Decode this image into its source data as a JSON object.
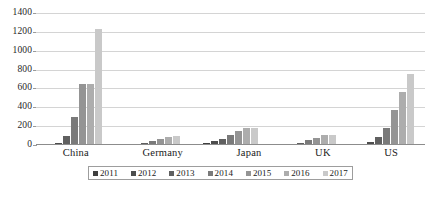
{
  "chart_data": {
    "type": "bar",
    "title": "",
    "subtitle": "",
    "xlabel": "",
    "ylabel": "",
    "categories": [
      "China",
      "Germany",
      "Japan",
      "UK",
      "US"
    ],
    "ylim": [
      0,
      1400
    ],
    "yticks": [
      1400,
      1200,
      1000,
      800,
      600,
      400,
      200,
      0
    ],
    "grid": true,
    "legend_position": "bottom",
    "series": [
      {
        "name": "2011",
        "color": "#3f3f3f",
        "values": [
          8,
          3,
          22,
          4,
          14
        ]
      },
      {
        "name": "2012",
        "color": "#4d4d4d",
        "values": [
          22,
          8,
          40,
          9,
          36
        ]
      },
      {
        "name": "2013",
        "color": "#606060",
        "values": [
          95,
          22,
          68,
          22,
          88
        ]
      },
      {
        "name": "2014",
        "color": "#7a7a7a",
        "values": [
          300,
          42,
          110,
          48,
          185
        ]
      },
      {
        "name": "2015",
        "color": "#949494",
        "values": [
          650,
          62,
          150,
          78,
          370
        ]
      },
      {
        "name": "2016",
        "color": "#adadad",
        "values": [
          650,
          82,
          178,
          105,
          560
        ]
      },
      {
        "name": "2017",
        "color": "#c9c9c9",
        "values": [
          1230,
          100,
          185,
          110,
          750
        ]
      }
    ]
  },
  "caption": {
    "sliver_text": ""
  }
}
